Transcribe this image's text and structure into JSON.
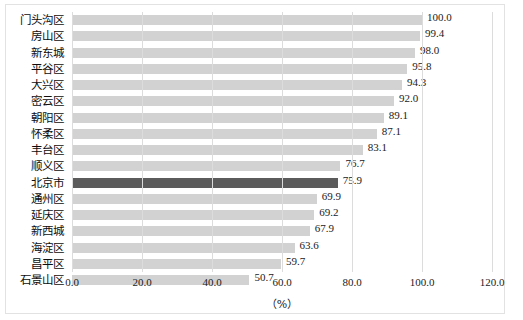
{
  "chart_data": {
    "type": "bar",
    "orientation": "horizontal",
    "title": "",
    "xlabel": "（%）",
    "ylabel": "",
    "xlim": [
      0.0,
      120.0
    ],
    "xticks": [
      "0.0",
      "20.0",
      "40.0",
      "60.0",
      "80.0",
      "100.0",
      "120.0"
    ],
    "xtick_values": [
      0,
      20,
      40,
      60,
      80,
      100,
      120
    ],
    "grid": "vertical",
    "legend": "none",
    "categories": [
      "门头沟区",
      "房山区",
      "新东城",
      "平谷区",
      "大兴区",
      "密云区",
      "朝阳区",
      "怀柔区",
      "丰台区",
      "顺义区",
      "北京市",
      "通州区",
      "延庆区",
      "新西城",
      "海淀区",
      "昌平区",
      "石景山区"
    ],
    "values": [
      100.0,
      99.4,
      98.0,
      95.8,
      94.3,
      92.0,
      89.1,
      87.1,
      83.1,
      76.7,
      75.9,
      69.9,
      69.2,
      67.9,
      63.6,
      59.7,
      50.7
    ],
    "value_labels": [
      "100.0",
      "99.4",
      "98.0",
      "95.8",
      "94.3",
      "92.0",
      "89.1",
      "87.1",
      "83.1",
      "76.7",
      "75.9",
      "69.9",
      "69.2",
      "67.9",
      "63.6",
      "59.7",
      "50.7"
    ],
    "highlight_index": 10,
    "colors": {
      "bar": "#d2d2d2",
      "bar_highlight": "#5b5b5b",
      "gridline": "#dcdcdc",
      "border": "#e2e2e2",
      "text": "#0d0d0d"
    }
  }
}
